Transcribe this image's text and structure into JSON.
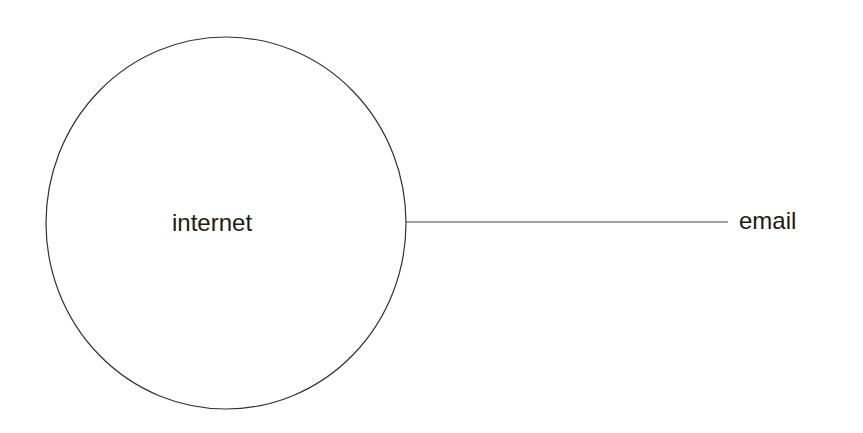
{
  "diagram": {
    "nodes": [
      {
        "id": "internet",
        "label": "internet",
        "shape": "circle"
      },
      {
        "id": "email",
        "label": "email",
        "shape": "text"
      }
    ],
    "edges": [
      {
        "from": "internet",
        "to": "email"
      }
    ],
    "colors": {
      "stroke": "#333333",
      "text": "#1a1a1a",
      "background": "#ffffff"
    }
  }
}
